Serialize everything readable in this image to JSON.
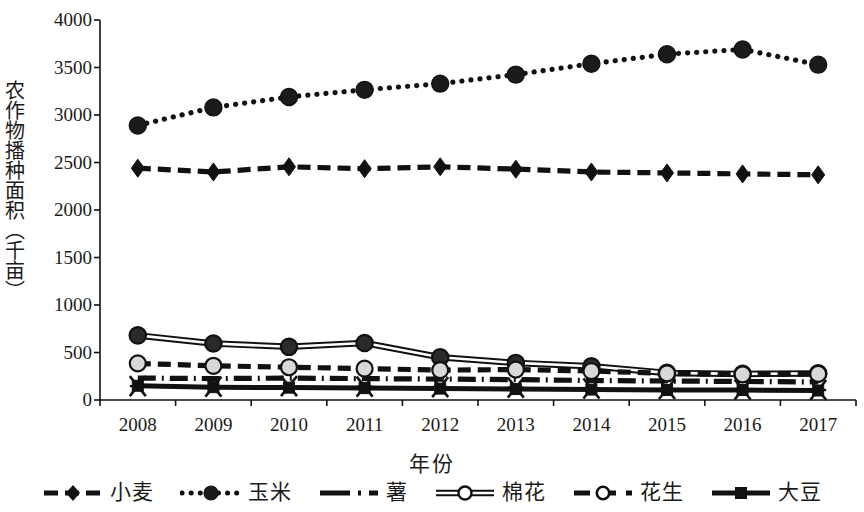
{
  "chart_data": {
    "type": "line",
    "title": "",
    "xlabel": "年份",
    "ylabel": "农作物播种面积（千亩）",
    "categories": [
      "2008",
      "2009",
      "2010",
      "2011",
      "2012",
      "2013",
      "2014",
      "2015",
      "2016",
      "2017"
    ],
    "x": [
      2008,
      2009,
      2010,
      2011,
      2012,
      2013,
      2014,
      2015,
      2016,
      2017
    ],
    "ylim": [
      0,
      4000
    ],
    "yticks": [
      "0",
      "500",
      "1000",
      "1500",
      "2000",
      "2500",
      "3000",
      "3500",
      "4000"
    ],
    "ytick_values": [
      0,
      500,
      1000,
      1500,
      2000,
      2500,
      3000,
      3500,
      4000
    ],
    "grid": false,
    "legend_position": "bottom",
    "series": [
      {
        "name": "小麦",
        "marker": "diamond-filled",
        "line_style": "dashed",
        "color": "#111111",
        "values": [
          2440,
          2400,
          2455,
          2435,
          2455,
          2430,
          2400,
          2390,
          2380,
          2370
        ]
      },
      {
        "name": "玉米",
        "marker": "circle-filled",
        "line_style": "dotted",
        "color": "#111111",
        "values": [
          2890,
          3080,
          3190,
          3265,
          3330,
          3425,
          3540,
          3640,
          3690,
          3530
        ]
      },
      {
        "name": "薯",
        "marker": "none",
        "line_style": "dash-dot",
        "color": "#111111",
        "values": [
          230,
          225,
          230,
          225,
          220,
          215,
          205,
          200,
          195,
          190
        ]
      },
      {
        "name": "棉花",
        "marker": "circle-open",
        "line_style": "solid-double",
        "color": "#111111",
        "values": [
          680,
          595,
          560,
          600,
          450,
          390,
          355,
          285,
          275,
          280
        ]
      },
      {
        "name": "花生",
        "marker": "circle-open",
        "line_style": "dashed",
        "color": "#111111",
        "values": [
          385,
          360,
          345,
          330,
          315,
          320,
          305,
          280,
          270,
          275
        ]
      },
      {
        "name": "大豆",
        "marker": "square-filled",
        "line_style": "solid",
        "color": "#111111",
        "values": [
          150,
          135,
          130,
          125,
          120,
          115,
          110,
          105,
          105,
          100
        ]
      }
    ],
    "cotton_markers_filled_note": "棉花 series markers render dark-filled in plot area"
  },
  "legend": {
    "items": [
      {
        "label": "小麦",
        "style": "dashed-diamond"
      },
      {
        "label": "玉米",
        "style": "dotted-circle"
      },
      {
        "label": "薯",
        "style": "dashdot-line"
      },
      {
        "label": "棉花",
        "style": "solid-open-circle"
      },
      {
        "label": "花生",
        "style": "dashed-open-circle"
      },
      {
        "label": "大豆",
        "style": "solid-filled-square"
      }
    ]
  }
}
